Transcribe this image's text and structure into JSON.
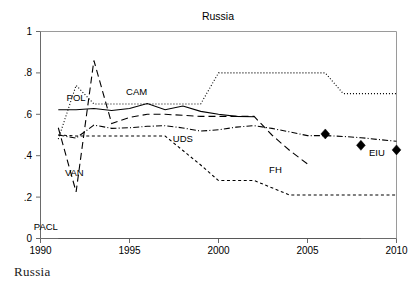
{
  "figure": {
    "title": "Russia",
    "caption": "Russia",
    "width": 415,
    "height": 295
  },
  "chart_data": {
    "type": "line",
    "title": "Russia",
    "xlabel": "",
    "ylabel": "",
    "xlim": [
      1990,
      2010
    ],
    "ylim": [
      0,
      1
    ],
    "grid": false,
    "legend": "inline-annotations",
    "xticks": [
      1990,
      1995,
      2000,
      2005,
      2010
    ],
    "xtick_labels": [
      "1990",
      "1995",
      "2000",
      "2005",
      "2010"
    ],
    "yticks": [
      0,
      0.2,
      0.4,
      0.6,
      0.8,
      1
    ],
    "ytick_labels": [
      "0",
      ".2",
      ".4",
      ".6",
      ".8",
      "1"
    ],
    "series": [
      {
        "name": "POL",
        "label": "POL",
        "style": "dotted",
        "color": "#000000",
        "label_x": 1992.0,
        "label_y": 0.665,
        "x": [
          1991,
          1992,
          1993,
          1994,
          1995,
          1996,
          1997,
          1998,
          1999,
          2000,
          2001,
          2002,
          2003,
          2004,
          2005,
          2006,
          2007,
          2008,
          2009,
          2010
        ],
        "values": [
          0.48,
          0.74,
          0.65,
          0.65,
          0.65,
          0.65,
          0.65,
          0.65,
          0.65,
          0.8,
          0.8,
          0.8,
          0.8,
          0.8,
          0.8,
          0.8,
          0.7,
          0.7,
          0.7,
          0.7
        ]
      },
      {
        "name": "VAN",
        "label": "VAN",
        "style": "long-dash",
        "color": "#000000",
        "label_x": 1991.9,
        "label_y": 0.3,
        "x": [
          1991,
          1992,
          1993,
          1994,
          1995,
          1996,
          1997,
          1998,
          1999,
          2000,
          2001,
          2002,
          2003,
          2004,
          2005
        ],
        "values": [
          0.535,
          0.225,
          0.86,
          0.555,
          0.585,
          0.6,
          0.6,
          0.595,
          0.59,
          0.59,
          0.59,
          0.59,
          0.5,
          0.425,
          0.36
        ]
      },
      {
        "name": "CAM",
        "label": "CAM",
        "style": "solid",
        "color": "#000000",
        "label_x": 1995.4,
        "label_y": 0.695,
        "x": [
          1991,
          1992,
          1993,
          1994,
          1995,
          1996,
          1997,
          1998,
          1999,
          2000,
          2001,
          2002
        ],
        "values": [
          0.622,
          0.622,
          0.628,
          0.618,
          0.628,
          0.652,
          0.622,
          0.64,
          0.614,
          0.6,
          0.59,
          0.588
        ]
      },
      {
        "name": "UDS",
        "label": "UDS",
        "style": "dash-dot",
        "color": "#000000",
        "label_x": 1998.0,
        "label_y": 0.468,
        "x": [
          1991,
          1992,
          1993,
          1994,
          1995,
          1996,
          1997,
          1998,
          1999,
          2000,
          2001,
          2002,
          2003,
          2004,
          2005,
          2006,
          2007,
          2008,
          2009,
          2010
        ],
        "values": [
          0.5,
          0.485,
          0.548,
          0.532,
          0.535,
          0.542,
          0.545,
          0.534,
          0.519,
          0.525,
          0.538,
          0.545,
          0.532,
          0.515,
          0.497,
          0.497,
          0.493,
          0.487,
          0.478,
          0.47
        ]
      },
      {
        "name": "FH",
        "label": "FH",
        "style": "short-dash",
        "color": "#000000",
        "label_x": 2003.2,
        "label_y": 0.318,
        "x": [
          1991,
          1992,
          1993,
          1994,
          1995,
          1996,
          1997,
          1998,
          1999,
          2000,
          2001,
          2002,
          2003,
          2004,
          2005,
          2006,
          2007,
          2008,
          2009,
          2010
        ],
        "values": [
          0.5,
          0.495,
          0.495,
          0.495,
          0.495,
          0.495,
          0.495,
          0.425,
          0.355,
          0.28,
          0.28,
          0.28,
          0.245,
          0.21,
          0.21,
          0.21,
          0.21,
          0.21,
          0.21,
          0.21
        ]
      },
      {
        "name": "PACL",
        "label": "PACL",
        "style": "thin-solid",
        "color": "#555555",
        "label_x": 1990.3,
        "label_y": 0.04,
        "x": [
          1991,
          2008
        ],
        "values": [
          0.0,
          0.0
        ]
      },
      {
        "name": "EIU",
        "label": "EIU",
        "style": "diamond-markers",
        "color": "#000000",
        "label_x": 2008.9,
        "label_y": 0.4,
        "x": [
          2006,
          2008,
          2010
        ],
        "values": [
          0.505,
          0.45,
          0.428
        ]
      }
    ]
  }
}
